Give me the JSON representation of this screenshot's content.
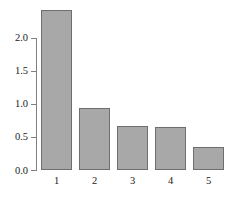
{
  "chart_data": {
    "type": "bar",
    "title": "",
    "subtitle": "",
    "xlabel": "",
    "ylabel": "",
    "categories": [
      "1",
      "2",
      "3",
      "4",
      "5"
    ],
    "values": [
      2.42,
      0.93,
      0.67,
      0.65,
      0.35
    ],
    "series": [
      {
        "name": "",
        "values": [
          2.42,
          0.93,
          0.67,
          0.65,
          0.35
        ]
      }
    ],
    "ylim": [
      0.0,
      2.5
    ],
    "xlim": [
      0.5,
      5.5
    ],
    "yticks": [
      "0.0",
      "0.5",
      "1.0",
      "1.5",
      "2.0"
    ],
    "ytick_values": [
      0.0,
      0.5,
      1.0,
      1.5,
      2.0
    ],
    "xticks": [
      "1",
      "2",
      "3",
      "4",
      "5"
    ],
    "grid": false,
    "legend": null,
    "legend_position": "none",
    "annotations": [],
    "colors": {
      "bar_fill": "#a8a8a8",
      "bar_edge": "#6e6e6e",
      "axis": "#808080",
      "text": "#1a1a1a",
      "background": "#ffffff"
    }
  }
}
